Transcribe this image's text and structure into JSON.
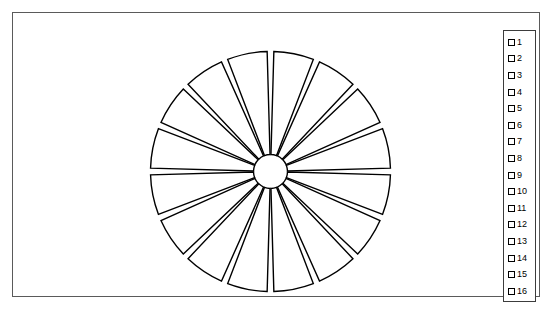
{
  "figure": {
    "background_color": "#ffffff",
    "frame_color": "#5a5a5a"
  },
  "legend": {
    "border_color": "#3c3c3c",
    "swatch_fill": "#ffffff",
    "swatch_edge": "#000000",
    "entries": [
      {
        "label": "1"
      },
      {
        "label": "2"
      },
      {
        "label": "3"
      },
      {
        "label": "4"
      },
      {
        "label": "5"
      },
      {
        "label": "6"
      },
      {
        "label": "7"
      },
      {
        "label": "8"
      },
      {
        "label": "9"
      },
      {
        "label": "10"
      },
      {
        "label": "11"
      },
      {
        "label": "12"
      },
      {
        "label": "13"
      },
      {
        "label": "14"
      },
      {
        "label": "15"
      },
      {
        "label": "16"
      }
    ]
  },
  "chart_data": {
    "type": "pie",
    "title": "",
    "labels": [
      "1",
      "2",
      "3",
      "4",
      "5",
      "6",
      "7",
      "8",
      "9",
      "10",
      "11",
      "12",
      "13",
      "14",
      "15",
      "16"
    ],
    "values": [
      1,
      1,
      1,
      1,
      1,
      1,
      1,
      1,
      1,
      1,
      1,
      1,
      1,
      1,
      1,
      1
    ],
    "percentages": [
      6.25,
      6.25,
      6.25,
      6.25,
      6.25,
      6.25,
      6.25,
      6.25,
      6.25,
      6.25,
      6.25,
      6.25,
      6.25,
      6.25,
      6.25,
      6.25
    ],
    "slice_count": 16,
    "slice_angle_deg": 22.5,
    "start_angle_deg": 90,
    "direction": "clockwise",
    "exploded": true,
    "gap_deg": 3.2,
    "inner_radius_px": 17,
    "outer_radius_px": 120,
    "center_px": [
      257,
      158
    ],
    "slice_fill": "#ffffff",
    "slice_edge": "#000000",
    "edge_width_px": 1.4,
    "legend_position": "right",
    "grid": false,
    "axis_visible": false
  }
}
